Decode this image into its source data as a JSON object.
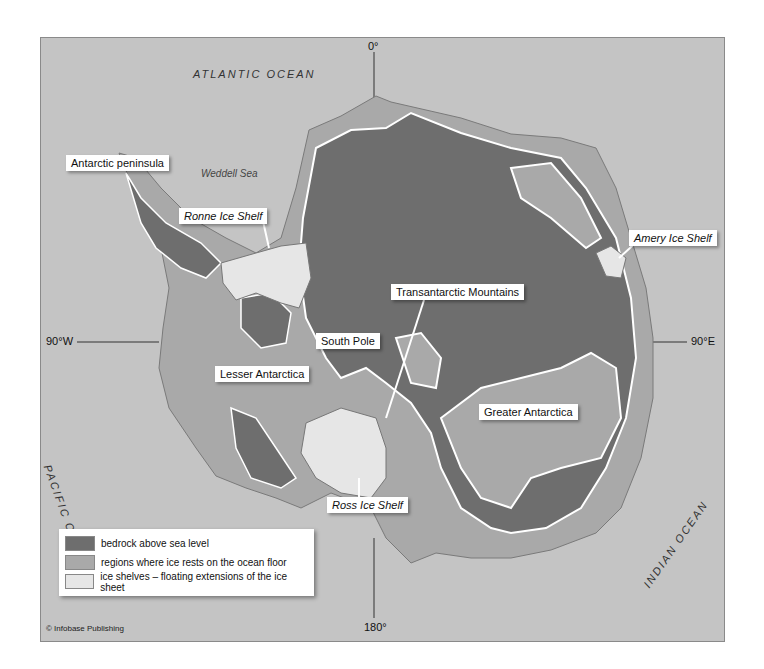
{
  "map": {
    "oceans": [
      {
        "id": "atlantic",
        "label": "ATLANTIC OCEAN"
      },
      {
        "id": "pacific",
        "label": "PACIFIC OCEAN"
      },
      {
        "id": "indian",
        "label": "INDIAN OCEAN"
      }
    ],
    "seas": [
      {
        "id": "weddell",
        "label": "Weddell Sea"
      }
    ],
    "coordinates": {
      "north": "0°",
      "south": "180°",
      "west": "90°W",
      "east": "90°E"
    },
    "labels": {
      "antarctic_peninsula": "Antarctic peninsula",
      "ronne": "Ronne Ice Shelf",
      "amery": "Amery Ice Shelf",
      "transantarctic": "Transantarctic Mountains",
      "south_pole": "South Pole",
      "lesser": "Lesser Antarctica",
      "greater": "Greater Antarctica",
      "ross": "Ross Ice Shelf"
    },
    "colors": {
      "ocean": "#c4c4c4",
      "bedrock": "#6e6e6e",
      "ocean_floor_ice": "#a9a9a9",
      "ice_shelf": "#e6e6e6",
      "outline": "#ffffff"
    }
  },
  "legend": {
    "items": [
      {
        "label": "bedrock above sea level",
        "color": "#6e6e6e"
      },
      {
        "label": "regions where ice rests on the ocean floor",
        "color": "#a9a9a9"
      },
      {
        "label": "ice shelves – floating extensions of the ice sheet",
        "color": "#e6e6e6"
      }
    ]
  },
  "credit": "© Infobase Publishing"
}
